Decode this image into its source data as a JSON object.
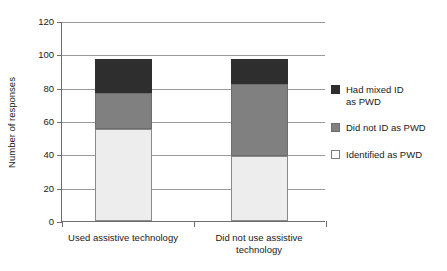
{
  "chart_data": {
    "type": "bar",
    "subtype": "stacked",
    "title": "",
    "xlabel": "",
    "ylabel": "Number of responses",
    "categories": [
      "Used assistive technology",
      "Did not use assistive technology"
    ],
    "series": [
      {
        "name": "Identified as PWD",
        "values": [
          55,
          39
        ],
        "color": "#ededed"
      },
      {
        "name": "Did not ID as PWD",
        "values": [
          22,
          43
        ],
        "color": "#808080"
      },
      {
        "name": "Had mixed ID as PWD",
        "values": [
          20,
          15
        ],
        "color": "#2e2e2e"
      }
    ],
    "stack_totals": [
      97,
      97
    ],
    "ylim": [
      0,
      120
    ],
    "yticks": [
      0,
      20,
      40,
      60,
      80,
      100,
      120
    ],
    "grid": true,
    "legend_position": "right"
  },
  "axis": {
    "y_title": "Number of responses",
    "y_ticks": [
      "0",
      "20",
      "40",
      "60",
      "80",
      "100",
      "120"
    ],
    "x_categories": [
      {
        "line1": "Used assistive technology",
        "line2": ""
      },
      {
        "line1": "Did not use assistive",
        "line2": "technology"
      }
    ]
  },
  "legend": {
    "items": [
      {
        "line1": "Had mixed ID",
        "line2": "as PWD",
        "swatch": "dark"
      },
      {
        "line1": "Did not ID as PWD",
        "line2": "",
        "swatch": "mid"
      },
      {
        "line1": "Identified as PWD",
        "line2": "",
        "swatch": "light"
      }
    ]
  },
  "colors": {
    "dark": "#2e2e2e",
    "mid": "#808080",
    "light": "#ededed",
    "axis": "#6e6e6e",
    "grid": "#9a9a9a"
  }
}
